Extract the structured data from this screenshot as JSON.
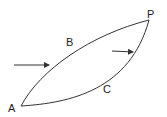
{
  "diagram": {
    "points": {
      "A": {
        "label": "A",
        "x": 21,
        "y": 106
      },
      "P": {
        "label": "P",
        "x": 149,
        "y": 20
      }
    },
    "paths": {
      "B": {
        "label": "B",
        "description": "upper curved path from A to P"
      },
      "C": {
        "label": "C",
        "description": "lower curved path from A to P"
      }
    },
    "arrows": [
      {
        "name": "left-arrow",
        "from": [
          14,
          65
        ],
        "to": [
          49,
          65
        ]
      },
      {
        "name": "right-arrow",
        "from": [
          112,
          51
        ],
        "to": [
          133,
          52
        ]
      }
    ],
    "colors": {
      "stroke": "#333333",
      "background": "#ffffff"
    }
  }
}
